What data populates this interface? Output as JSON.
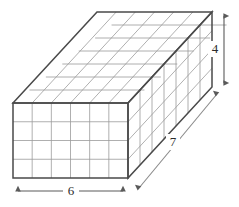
{
  "figure": {
    "shape": "rectangular-prism",
    "projection": "oblique",
    "dimensions": {
      "width_label": "6",
      "height_label": "4",
      "depth_label": "7",
      "width_units": 6,
      "height_units": 4,
      "depth_units": 7
    },
    "faces": {
      "front": {
        "columns": 6,
        "rows": 4
      },
      "top": {
        "columns": 6,
        "rows": 7
      },
      "right": {
        "columns": 7,
        "rows": 4
      }
    },
    "colors": {
      "outline": "#4a4a4a",
      "gridline": "#9a9a9a",
      "fill": "#ffffff",
      "arrow": "#5a5a5a",
      "label_text": "#2b2b2b"
    },
    "annotations": [
      {
        "name": "width-dimension",
        "label": "6",
        "orientation": "horizontal",
        "position": "bottom"
      },
      {
        "name": "height-dimension",
        "label": "4",
        "orientation": "vertical",
        "position": "right"
      },
      {
        "name": "depth-dimension",
        "label": "7",
        "orientation": "diagonal",
        "position": "lower-right"
      }
    ]
  }
}
